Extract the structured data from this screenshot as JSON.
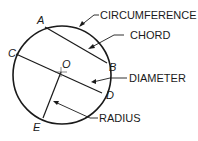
{
  "diagram": {
    "type": "circle-parts",
    "points": {
      "A": "A",
      "B": "B",
      "C": "C",
      "D": "D",
      "E": "E",
      "O": "O"
    },
    "labels": {
      "circumference": "CIRCUMFERENCE",
      "chord": "CHORD",
      "diameter": "DIAMETER",
      "radius": "RADIUS"
    }
  }
}
